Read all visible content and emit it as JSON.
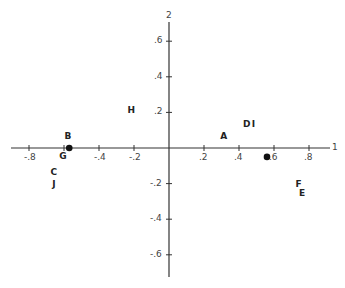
{
  "chart_data": {
    "type": "scatter",
    "title": "",
    "xlabel": "1",
    "ylabel": "2",
    "xlim": [
      -0.92,
      0.94
    ],
    "ylim": [
      -0.74,
      0.72
    ],
    "grid": false,
    "x_ticks": [
      "-.8",
      "-.6",
      "-.4",
      "-.2",
      ".2",
      ".4",
      ".6",
      ".8"
    ],
    "x_tick_values": [
      -0.8,
      -0.6,
      -0.4,
      -0.2,
      0.2,
      0.4,
      0.6,
      0.8
    ],
    "y_ticks": [
      ".6",
      ".4",
      ".2",
      "-.2",
      "-.4",
      "-.6"
    ],
    "y_tick_values": [
      0.6,
      0.4,
      0.2,
      -0.2,
      -0.4,
      -0.6
    ],
    "points": [
      {
        "label": "A",
        "x": 0.31,
        "y": 0.06
      },
      {
        "label": "B",
        "x": -0.58,
        "y": 0.06
      },
      {
        "label": "C",
        "x": -0.66,
        "y": -0.14
      },
      {
        "label": "D",
        "x": 0.44,
        "y": 0.13
      },
      {
        "label": "E",
        "x": 0.76,
        "y": -0.26
      },
      {
        "label": "F",
        "x": 0.74,
        "y": -0.21
      },
      {
        "label": "G",
        "x": -0.61,
        "y": -0.05
      },
      {
        "label": "H",
        "x": -0.22,
        "y": 0.21
      },
      {
        "label": "I",
        "x": 0.49,
        "y": 0.13
      },
      {
        "label": "J",
        "x": -0.65,
        "y": -0.21
      }
    ],
    "markers": [
      {
        "name": "centroid-1",
        "x": -0.57,
        "y": 0.0
      },
      {
        "name": "centroid-2",
        "x": 0.56,
        "y": -0.05
      }
    ]
  },
  "axis_labels": {
    "x": "1",
    "y": "2"
  }
}
